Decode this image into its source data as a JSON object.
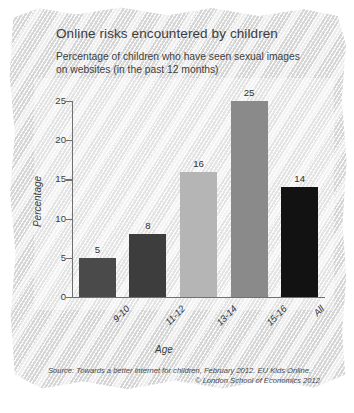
{
  "title": "Online risks encountered by children",
  "subtitle": "Percentage of children who have seen sexual images on websites (in the past 12 months)",
  "source": {
    "line1": "Source: Towards a better internet for children, February 2012. EU Kids Online.",
    "line2": "© London School of Economics 2012"
  },
  "chart_data": {
    "type": "bar",
    "title": "Online risks encountered by children",
    "subtitle": "Percentage of children who have seen sexual images on websites (in the past 12 months)",
    "categories": [
      "9-10",
      "11-12",
      "13-14",
      "15-16",
      "All"
    ],
    "values": [
      5,
      8,
      16,
      25,
      14
    ],
    "bar_colors": [
      "#4a4a4a",
      "#3d3d3d",
      "#b5b5b5",
      "#8a8a8a",
      "#121212"
    ],
    "xlabel": "Age",
    "ylabel": "Percentage",
    "ylim": [
      0,
      25
    ],
    "yticks": [
      0,
      5,
      10,
      15,
      20,
      25
    ],
    "ytick_labels": [
      "0",
      "5",
      "10",
      "15",
      "20",
      "25"
    ],
    "data_labels": [
      "5",
      "8",
      "16",
      "25",
      "14"
    ],
    "grid": false,
    "legend": false,
    "axis_color": "#707070",
    "background": "hatched-sketch-gray"
  }
}
